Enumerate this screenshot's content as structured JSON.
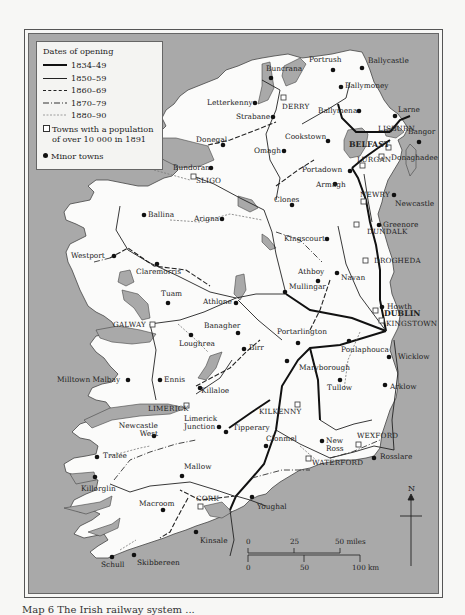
{
  "legend": {
    "title": "Dates of opening",
    "periods": [
      {
        "label": "1834–49",
        "style": "thick-solid"
      },
      {
        "label": "1850–59",
        "style": "thin-solid"
      },
      {
        "label": "1860–69",
        "style": "dashed"
      },
      {
        "label": "1870–79",
        "style": "dash-dot"
      },
      {
        "label": "1880–90",
        "style": "dotted-light"
      }
    ],
    "towns_large": "Towns with a population of over 10 000 in 1891",
    "towns_large_line1": "Towns with a population",
    "towns_large_line2": "of over 10 000 in 1891",
    "towns_minor": "Minor towns"
  },
  "large_towns": [
    "DERRY",
    "BELFAST",
    "LISBURN",
    "LURGAN",
    "NEWRY",
    "SLIGO",
    "DUNDALK",
    "DROGHEDA",
    "DUBLIN",
    "KINGSTOWN",
    "GALWAY",
    "LIMERICK",
    "KILKENNY",
    "WEXFORD",
    "WATERFORD",
    "CORK"
  ],
  "minor_towns": [
    "Portrush",
    "Ballycastle",
    "Buncrana",
    "Ballymoney",
    "Letterkenny",
    "Strabane",
    "Ballymena",
    "Larne",
    "Cookstown",
    "Bangor",
    "Donegal",
    "Omagh",
    "Donaghadee",
    "Bundoran",
    "Portadown",
    "Armagh",
    "Newcastle",
    "Clones",
    "Ballina",
    "Arigna",
    "Greenore",
    "Kingscourt",
    "Westport",
    "Claremorris",
    "Athboy",
    "Navan",
    "Tuam",
    "Athlone",
    "Mullingar",
    "Howth",
    "Banagher",
    "Loughrea",
    "Portarlington",
    "Birr",
    "Poulaphouca",
    "Wicklow",
    "Maryborough",
    "Milltown Malbay",
    "Ennis",
    "Killaloe",
    "Tullow",
    "Arklow",
    "Limerick Junction",
    "Newcastle West",
    "Tipperary",
    "Clonmel",
    "New Ross",
    "Rosslare",
    "Tralee",
    "Mallow",
    "Killorglin",
    "Macroom",
    "Youghal",
    "Kinsale",
    "Schull",
    "Skibbereen"
  ],
  "scale": {
    "miles": [
      "0",
      "25",
      "50 miles"
    ],
    "km": [
      "0",
      "50",
      "100 km"
    ]
  },
  "north_label": "N",
  "caption": "Map 6  The Irish railway system ..."
}
